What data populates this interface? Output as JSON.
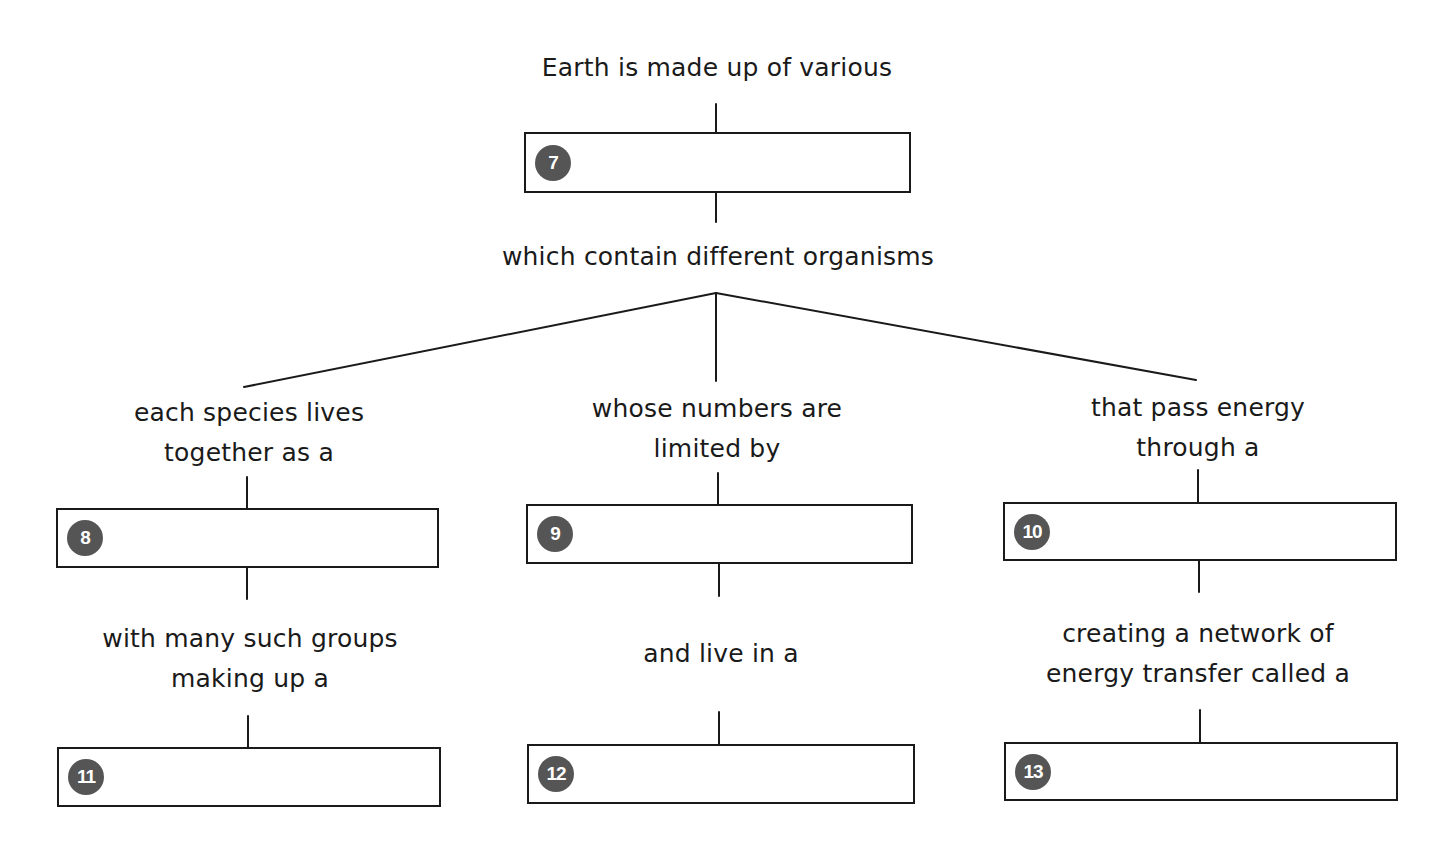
{
  "diagram": {
    "colors": {
      "line": "#1a1a1a",
      "badge": "#555555",
      "badge_text": "#ffffff",
      "background": "#ffffff"
    },
    "root": {
      "intro_text": "Earth is made up of various",
      "box": {
        "number": "7",
        "value": ""
      },
      "after_text": "which contain different organisms"
    },
    "branches": [
      {
        "id": "left",
        "top_text": [
          "each species lives",
          "together as a"
        ],
        "box1": {
          "number": "8",
          "value": ""
        },
        "middle_text": [
          "with many such groups",
          "making up a"
        ],
        "box2": {
          "number": "11",
          "value": ""
        }
      },
      {
        "id": "center",
        "top_text": [
          "whose numbers are",
          "limited by"
        ],
        "box1": {
          "number": "9",
          "value": ""
        },
        "middle_text": [
          "and live in a"
        ],
        "box2": {
          "number": "12",
          "value": ""
        }
      },
      {
        "id": "right",
        "top_text": [
          "that pass energy",
          "through a"
        ],
        "box1": {
          "number": "10",
          "value": ""
        },
        "middle_text": [
          "creating a network of",
          "energy transfer called a"
        ],
        "box2": {
          "number": "13",
          "value": ""
        }
      }
    ]
  }
}
